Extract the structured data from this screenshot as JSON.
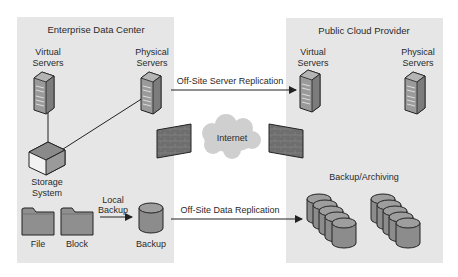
{
  "colors": {
    "background": "#ffffff",
    "panel": "#e6e6e6",
    "server_body": "#9a9a9a",
    "server_front": "#7c7c7c",
    "firewall": "#6e6e6e",
    "cloud": "#cfcfcf",
    "storage_top": "#8a8a8a",
    "disk": "#8c8c8c",
    "folder": "#8f8f8f",
    "line": "#222222"
  },
  "enterprise": {
    "title": "Enterprise Data Center",
    "virtual_servers": [
      "Virtual",
      "Servers"
    ],
    "physical_servers": [
      "Physical",
      "Servers"
    ],
    "storage_system": [
      "Storage",
      "System"
    ],
    "file": "File",
    "block": "Block",
    "local_backup": [
      "Local",
      "Backup"
    ],
    "backup": "Backup"
  },
  "cloud_provider": {
    "title": "Public Cloud Provider",
    "virtual_servers": [
      "Virtual",
      "Servers"
    ],
    "physical_servers": [
      "Physical",
      "Servers"
    ],
    "backup_archiving": "Backup/Archiving"
  },
  "connections": {
    "server_replication": "Off-Site Server Replication",
    "data_replication": "Off-Site Data Replication",
    "internet": "Internet"
  }
}
